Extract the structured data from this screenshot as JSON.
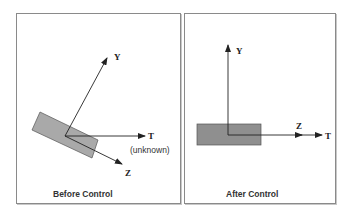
{
  "panels": [
    {
      "id": "before",
      "caption": "Before Control",
      "axes": {
        "y_label": "Y",
        "t_label": "T",
        "t_note": "(unknown)",
        "z_label": "Z"
      },
      "body_color": "#a9a9a9"
    },
    {
      "id": "after",
      "caption": "After Control",
      "axes": {
        "y_label": "Y",
        "z_label": "Z",
        "t_label": "T"
      },
      "body_color": "#8f8f8f"
    }
  ],
  "colors": {
    "axis": "#222222",
    "frame": "#8a8a8a"
  }
}
